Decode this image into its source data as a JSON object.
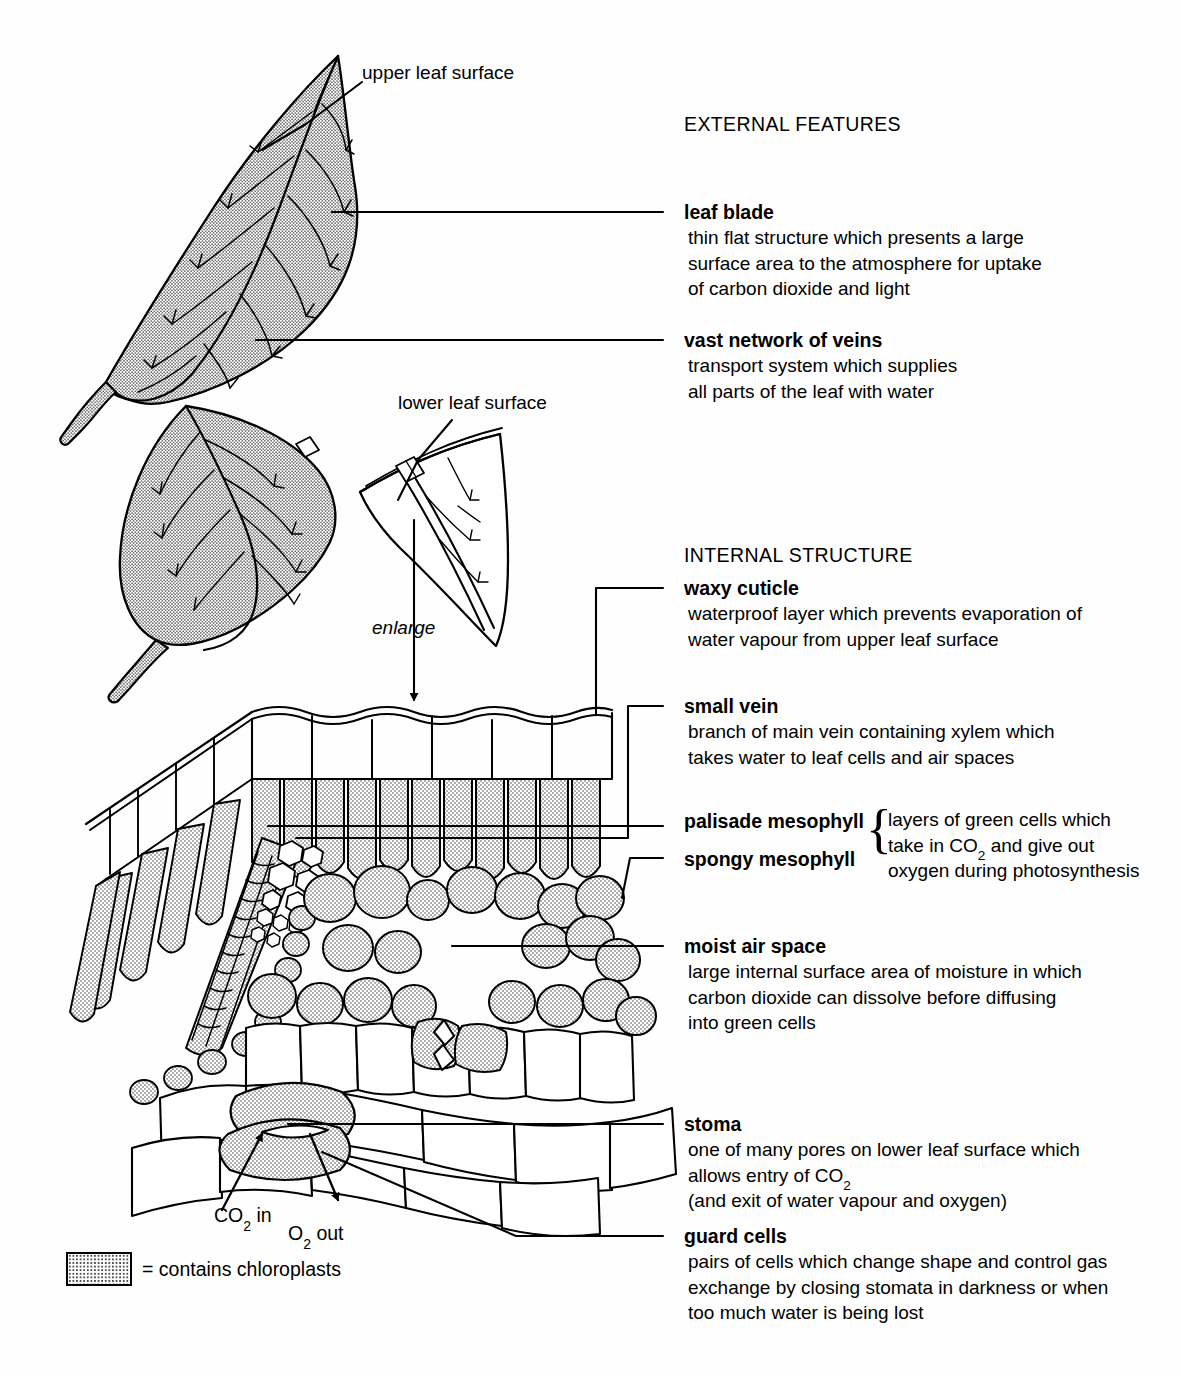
{
  "figure": {
    "title_external": "EXTERNAL FEATURES",
    "title_internal": "INTERNAL STRUCTURE"
  },
  "diagram_labels": {
    "upper_leaf_surface": "upper leaf surface",
    "lower_leaf_surface": "lower leaf surface",
    "enlarge": "enlarge",
    "co2_in": "CO2 in",
    "o2_out": "O2 out"
  },
  "external_features": [
    {
      "term": "leaf blade",
      "desc": [
        "thin flat structure which presents a large",
        "surface area to the atmosphere for uptake",
        "of carbon dioxide and light"
      ]
    },
    {
      "term": "vast network of veins",
      "desc": [
        "transport system which supplies",
        "all parts of the leaf with water"
      ]
    }
  ],
  "internal_structure": [
    {
      "term": "waxy cuticle",
      "desc": [
        "waterproof layer which prevents evaporation of",
        "water vapour from upper leaf surface"
      ]
    },
    {
      "term": "small vein",
      "desc": [
        "branch of main vein containing xylem which",
        "takes water to leaf cells and air spaces"
      ]
    },
    {
      "term": "moist air space",
      "desc": [
        "large internal surface area of moisture in which",
        "carbon dioxide can dissolve before diffusing",
        "into green cells"
      ]
    },
    {
      "term": "stoma",
      "desc": [
        "one of many pores on lower leaf surface which",
        "allows entry of CO2",
        "(and exit of water vapour and oxygen)"
      ]
    },
    {
      "term": "guard cells",
      "desc": [
        "pairs of cells which change shape and control gas",
        "exchange by closing stomata in darkness or when",
        "too much water is being lost"
      ]
    }
  ],
  "mesophyll_pair": {
    "term_top": "palisade mesophyll",
    "term_bottom": "spongy mesophyll",
    "brace": "{",
    "desc": [
      "layers of green cells which",
      "take in CO2 and give out",
      "oxygen during photosynthesis"
    ]
  },
  "legend": {
    "text": "= contains chloroplasts",
    "swatch_name": "stipple-chloroplast-swatch"
  },
  "colors": {
    "ink": "#000000",
    "paper": "#fefefe",
    "stipple": "#4a4a4a"
  }
}
